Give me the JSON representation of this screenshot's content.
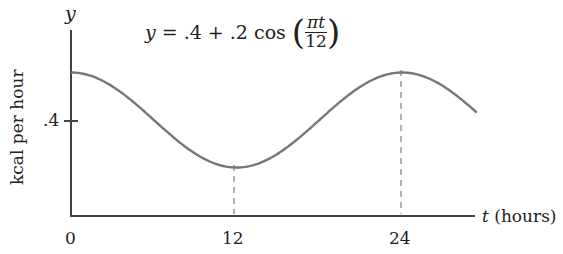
{
  "chart_data": {
    "type": "line",
    "equation": {
      "lhs": "y",
      "rhs_prefix": "= .4 + .2 cos",
      "numerator": "πt",
      "denominator": "12"
    },
    "xlabel": "t (hours)",
    "xlabel_var": "t",
    "xlabel_unit": "(hours)",
    "ylabel": "kcal per hour",
    "yaxis_var": "y",
    "x_ticks": [
      "0",
      "12",
      "24"
    ],
    "y_ticks": [
      ".4"
    ],
    "xlim": [
      0,
      29.4
    ],
    "ylim": [
      0,
      0.65
    ],
    "grid": false,
    "annotations": [
      "dashed vertical line at t=12 (minimum)",
      "dashed vertical line at t=24 (maximum)"
    ],
    "series": [
      {
        "name": "y = .4 + .2cos(πt/12)",
        "x": [
          0,
          3,
          6,
          9,
          12,
          15,
          18,
          21,
          24,
          27,
          29.4
        ],
        "values": [
          0.6,
          0.541,
          0.4,
          0.259,
          0.2,
          0.259,
          0.4,
          0.541,
          0.6,
          0.541,
          0.45
        ]
      }
    ]
  }
}
